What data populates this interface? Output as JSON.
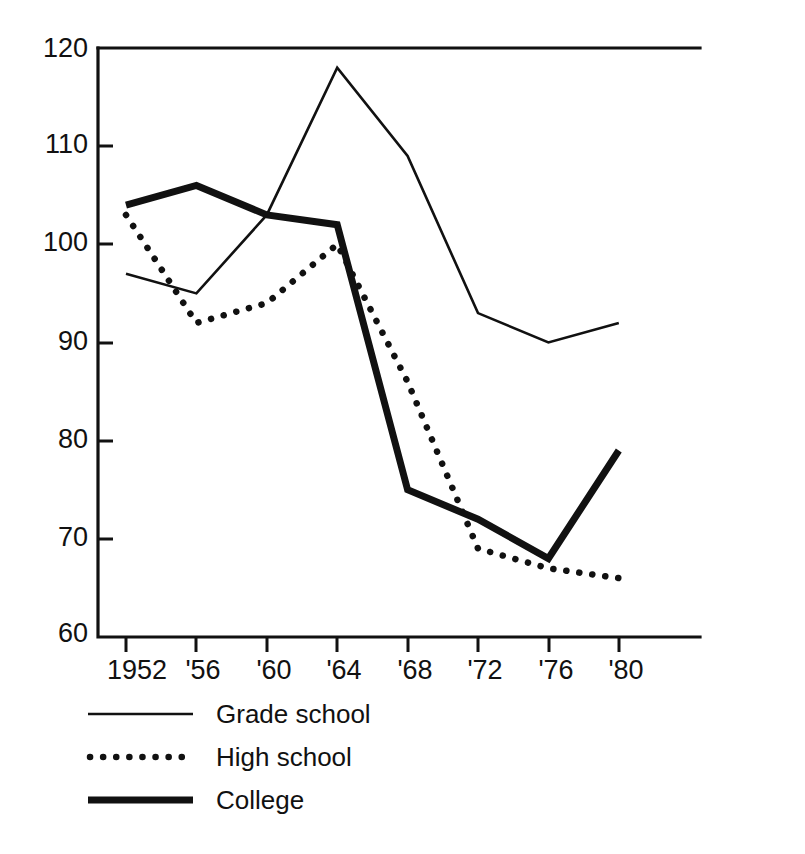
{
  "chart_data": {
    "type": "line",
    "title": "",
    "subtitle": "",
    "xlabel": "",
    "ylabel": "",
    "categories": [
      "1952",
      "'56",
      "'60",
      "'64",
      "'68",
      "'72",
      "'76",
      "'80"
    ],
    "x_tick_labels": [
      "1952",
      "'56",
      "'60",
      "'64",
      "'68",
      "'72",
      "'76",
      "'80"
    ],
    "y_tick_labels": [
      "60",
      "70",
      "80",
      "90",
      "100",
      "110",
      "120"
    ],
    "y_ticks": [
      60,
      70,
      80,
      90,
      100,
      110,
      120
    ],
    "ylim": [
      60,
      120
    ],
    "grid": false,
    "legend_position": "bottom-left",
    "series": [
      {
        "name": "Grade school",
        "style": "thin-solid",
        "values": [
          97,
          95,
          103,
          118,
          109,
          93,
          90,
          92
        ]
      },
      {
        "name": "High school",
        "style": "dotted",
        "values": [
          103,
          92,
          94,
          100,
          86,
          69,
          67,
          66
        ]
      },
      {
        "name": "College",
        "style": "thick-solid",
        "values": [
          104,
          106,
          103,
          102,
          75,
          72,
          68,
          79
        ]
      }
    ]
  },
  "axis": {
    "y_labels": [
      "120",
      "110",
      "100",
      "90",
      "80",
      "70",
      "60"
    ],
    "x_labels": [
      "1952",
      "'56",
      "'60",
      "'64",
      "'68",
      "'72",
      "'76",
      "'80"
    ]
  },
  "legend": {
    "items": [
      {
        "label": "Grade school",
        "style": "thin-solid"
      },
      {
        "label": "High school",
        "style": "dotted"
      },
      {
        "label": "College",
        "style": "thick-solid"
      }
    ]
  },
  "colors": {
    "ink": "#111111",
    "background": "#ffffff"
  }
}
